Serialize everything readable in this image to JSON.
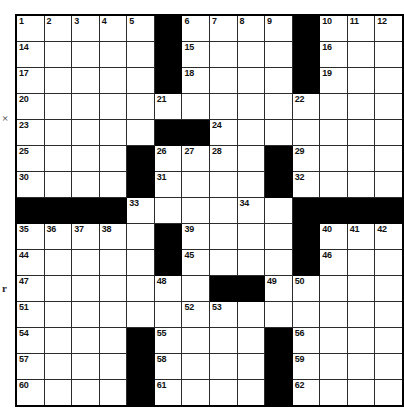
{
  "puzzle": {
    "title": "Crossword Grid",
    "columns": 14,
    "rows": 15,
    "colors": {
      "block": "#000000",
      "cell": "#ffffff",
      "grid_line": "#2b2b2b",
      "border": "#000000",
      "number_text": "#111111"
    },
    "margin_marks": [
      {
        "name": "left-margin-mark-upper",
        "text": "×"
      },
      {
        "name": "left-margin-mark-lower",
        "text": "r"
      }
    ],
    "grid": [
      [
        {
          "n": "1"
        },
        {
          "n": "2"
        },
        {
          "n": "3"
        },
        {
          "n": "4"
        },
        {
          "n": "5"
        },
        {
          "b": true
        },
        {
          "n": "6"
        },
        {
          "n": "7"
        },
        {
          "n": "8"
        },
        {
          "n": "9"
        },
        {
          "b": true
        },
        {
          "n": "10"
        },
        {
          "n": "11"
        },
        {
          "n": "12"
        },
        {
          "n": "13"
        }
      ],
      [
        {
          "n": "14"
        },
        {},
        {},
        {},
        {},
        {
          "b": true
        },
        {
          "n": "15"
        },
        {},
        {},
        {},
        {
          "b": true
        },
        {
          "n": "16"
        },
        {},
        {},
        {}
      ],
      [
        {
          "n": "17"
        },
        {},
        {},
        {},
        {},
        {
          "b": true
        },
        {
          "n": "18"
        },
        {},
        {},
        {},
        {
          "b": true
        },
        {
          "n": "19"
        },
        {},
        {},
        {}
      ],
      [
        {
          "n": "20"
        },
        {},
        {},
        {},
        {},
        {
          "n": "21"
        },
        {},
        {},
        {},
        {},
        {
          "n": "22"
        },
        {},
        {},
        {},
        {}
      ],
      [
        {
          "n": "23"
        },
        {},
        {},
        {},
        {},
        {
          "b": true
        },
        {
          "b": true
        },
        {
          "n": "24"
        },
        {},
        {},
        {},
        {},
        {},
        {},
        {}
      ],
      [
        {
          "n": "25"
        },
        {},
        {},
        {},
        {
          "b": true
        },
        {
          "n": "26"
        },
        {
          "n": "27"
        },
        {
          "n": "28"
        },
        {},
        {
          "b": true
        },
        {
          "n": "29"
        },
        {},
        {},
        {},
        {}
      ],
      [
        {
          "n": "30"
        },
        {},
        {},
        {},
        {
          "b": true
        },
        {
          "n": "31"
        },
        {},
        {},
        {},
        {
          "b": true
        },
        {
          "n": "32"
        },
        {},
        {},
        {},
        {}
      ],
      [
        {
          "b": true
        },
        {
          "b": true
        },
        {
          "b": true
        },
        {
          "b": true
        },
        {
          "n": "33"
        },
        {},
        {},
        {},
        {
          "n": "34"
        },
        {},
        {
          "b": true
        },
        {
          "b": true
        },
        {
          "b": true
        },
        {
          "b": true
        },
        {
          "b": true
        }
      ],
      [
        {
          "n": "35"
        },
        {
          "n": "36"
        },
        {
          "n": "37"
        },
        {
          "n": "38"
        },
        {},
        {
          "b": true
        },
        {
          "n": "39"
        },
        {},
        {},
        {},
        {
          "b": true
        },
        {
          "n": "40"
        },
        {
          "n": "41"
        },
        {
          "n": "42"
        },
        {
          "n": "43"
        }
      ],
      [
        {
          "n": "44"
        },
        {},
        {},
        {},
        {},
        {
          "b": true
        },
        {
          "n": "45"
        },
        {},
        {},
        {},
        {
          "b": true
        },
        {
          "n": "46"
        },
        {},
        {},
        {}
      ],
      [
        {
          "n": "47"
        },
        {},
        {},
        {},
        {},
        {
          "n": "48"
        },
        {},
        {
          "b": true
        },
        {
          "b": true
        },
        {
          "n": "49"
        },
        {
          "n": "50"
        },
        {},
        {},
        {},
        {}
      ],
      [
        {
          "n": "51"
        },
        {},
        {},
        {},
        {},
        {},
        {
          "n": "52"
        },
        {
          "n": "53"
        },
        {},
        {},
        {},
        {},
        {},
        {},
        {}
      ],
      [
        {
          "n": "54"
        },
        {},
        {},
        {},
        {
          "b": true
        },
        {
          "n": "55"
        },
        {},
        {},
        {},
        {
          "b": true
        },
        {
          "n": "56"
        },
        {},
        {},
        {},
        {}
      ],
      [
        {
          "n": "57"
        },
        {},
        {},
        {},
        {
          "b": true
        },
        {
          "n": "58"
        },
        {},
        {},
        {},
        {
          "b": true
        },
        {
          "n": "59"
        },
        {},
        {},
        {},
        {}
      ],
      [
        {
          "n": "60"
        },
        {},
        {},
        {},
        {
          "b": true
        },
        {
          "n": "61"
        },
        {},
        {},
        {},
        {
          "b": true
        },
        {
          "n": "62"
        },
        {},
        {},
        {},
        {}
      ]
    ]
  }
}
